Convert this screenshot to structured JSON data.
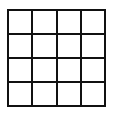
{
  "grid": {
    "rows": 4,
    "cols": 4,
    "line_color": "#111111",
    "cells": [
      [
        "",
        "",
        "",
        ""
      ],
      [
        "",
        "",
        "",
        ""
      ],
      [
        "",
        "",
        "",
        ""
      ],
      [
        "",
        "",
        "",
        ""
      ]
    ]
  }
}
